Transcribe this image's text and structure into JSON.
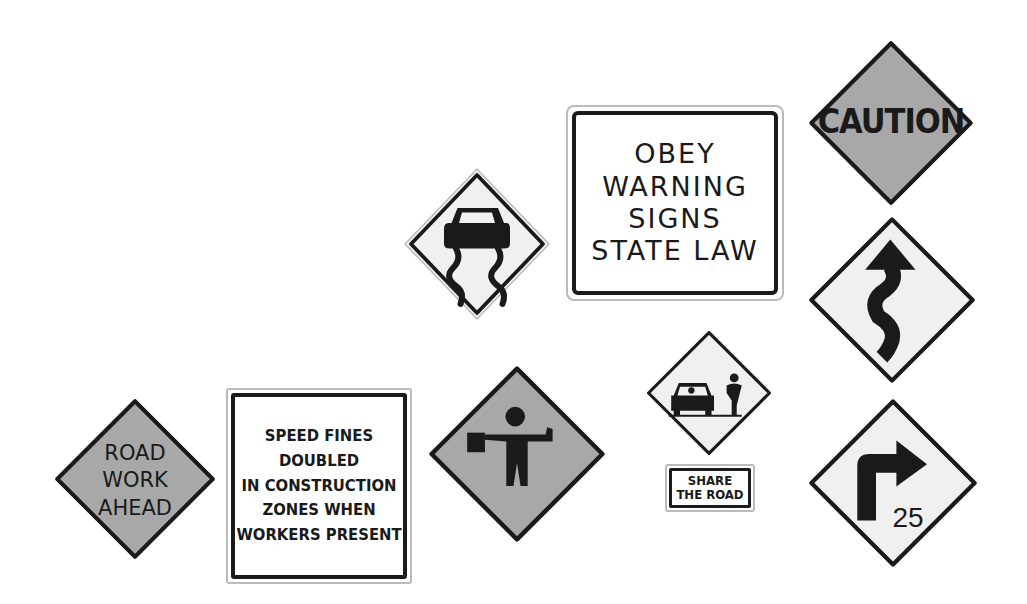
{
  "colors": {
    "orange_sign": "#a8a8a8",
    "yellow_sign": "#f0f0f0",
    "border": "#1a1a1a",
    "background": "#ffffff"
  },
  "signs": {
    "caution": {
      "text": "CAUTION",
      "shape": "diamond",
      "fill": "gray"
    },
    "obey": {
      "lines": [
        "OBEY",
        "WARNING",
        "SIGNS",
        "STATE LAW"
      ],
      "shape": "rectangle"
    },
    "slippery": {
      "icon": "slippery-road-car-icon",
      "shape": "diamond"
    },
    "winding": {
      "icon": "winding-road-arrow-icon",
      "shape": "diamond"
    },
    "share_road": {
      "icon": "car-and-cyclist-icon",
      "plaque_lines": [
        "SHARE",
        "THE ROAD"
      ],
      "shape": "diamond"
    },
    "flagger": {
      "icon": "flagger-icon",
      "shape": "diamond"
    },
    "speed_fines": {
      "lines": [
        "SPEED FINES",
        "DOUBLED",
        "IN CONSTRUCTION",
        "ZONES WHEN",
        "WORKERS PRESENT"
      ],
      "shape": "rectangle"
    },
    "road_work": {
      "lines": [
        "ROAD",
        "WORK",
        "AHEAD"
      ],
      "shape": "diamond"
    },
    "right_turn": {
      "icon": "right-turn-arrow-icon",
      "speed": "25",
      "shape": "diamond"
    }
  }
}
